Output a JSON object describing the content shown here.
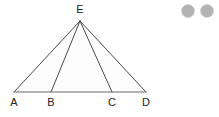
{
  "canvas": {
    "width": 219,
    "height": 117,
    "background": "#ffffff"
  },
  "figure": {
    "name": "triangle-with-cevians",
    "stroke_color": "#4a4a4a",
    "baseline_color": "#6b6b6b",
    "fill_color": "#fdfdfd",
    "points": {
      "A": {
        "label": "A",
        "x": 14,
        "y": 92,
        "label_x": 14,
        "label_y": 105
      },
      "B": {
        "label": "B",
        "x": 51,
        "y": 92,
        "label_x": 51,
        "label_y": 105
      },
      "C": {
        "label": "C",
        "x": 112,
        "y": 92,
        "label_x": 112,
        "label_y": 105
      },
      "D": {
        "label": "D",
        "x": 146,
        "y": 92,
        "label_x": 146,
        "label_y": 105
      },
      "E": {
        "label": "E",
        "x": 80,
        "y": 21,
        "label_x": 80,
        "label_y": 12
      }
    },
    "segments": [
      {
        "name": "segment-AE",
        "from": "A",
        "to": "E"
      },
      {
        "name": "segment-BE",
        "from": "B",
        "to": "E"
      },
      {
        "name": "segment-CE",
        "from": "C",
        "to": "E"
      },
      {
        "name": "segment-DE",
        "from": "D",
        "to": "E"
      },
      {
        "name": "segment-AD-baseline",
        "from": "A",
        "to": "D"
      }
    ]
  },
  "decorations": {
    "dots": [
      {
        "name": "gray-dot-1",
        "cx": 188,
        "cy": 11,
        "r": 6.5,
        "color": "#b3b3b3"
      },
      {
        "name": "gray-dot-2",
        "cx": 207,
        "cy": 11,
        "r": 6.5,
        "color": "#b3b3b3"
      }
    ]
  }
}
